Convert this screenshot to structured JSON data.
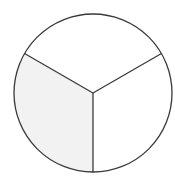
{
  "diagram": {
    "type": "fraction-circle",
    "title": "",
    "total_parts": 3,
    "shaded_parts": 1,
    "fraction_shaded": "1/3",
    "shaded_sector": "bottom-left",
    "colors": {
      "stroke": "#3a3a3a",
      "shaded_fill": "#f2f2f2",
      "unshaded_fill": "#ffffff",
      "background": "#ffffff"
    },
    "geometry": {
      "center": [
        93,
        93
      ],
      "radius": 79,
      "spoke_angles_deg": [
        90,
        210,
        330
      ]
    }
  }
}
